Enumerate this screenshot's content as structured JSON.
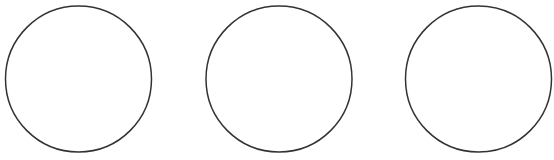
{
  "diagram": {
    "width": 554,
    "height": 160,
    "background": "#ffffff",
    "stroke_color": "#333333",
    "stroke_width": 1.5,
    "fill_color": "#ffffff",
    "circles": [
      {
        "cx": 78.5,
        "cy": 79,
        "r": 73
      },
      {
        "cx": 279,
        "cy": 79,
        "r": 73
      },
      {
        "cx": 478.5,
        "cy": 79,
        "r": 73
      }
    ]
  }
}
